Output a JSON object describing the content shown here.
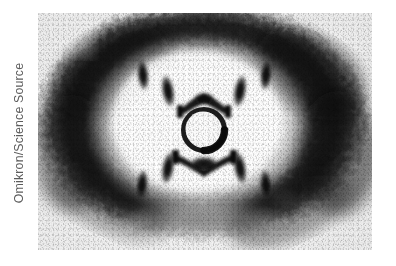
{
  "page": {
    "background_color": "#ffffff",
    "width": 396,
    "height": 266
  },
  "credit": {
    "text": "Omikron/Science Source",
    "color": "#5c5c5c",
    "orientation": "vertical-rotated-90-ccw",
    "position": "left-edge"
  },
  "photo": {
    "kind": "x-ray-diffraction-photograph",
    "subject": "DNA B-form fibre diffraction pattern (Photo 51)",
    "rendering": "black-and-white halftone print",
    "frame": {
      "x": 38,
      "y": 13,
      "width": 334,
      "height": 237
    },
    "colors": {
      "paper": "#f4f4f4",
      "bright_center": "#fbfbfb",
      "halo_dark": "#1c1c1c",
      "spot_dark": "#121212",
      "mid_gray": "#8a8a8a"
    },
    "features": {
      "outer_halo": {
        "label": "diffuse dark elliptical halo ring",
        "center_x": 196,
        "center_y": 118,
        "radius_x": 162,
        "radius_y": 116,
        "band_thickness": 46
      },
      "beamstop": {
        "label": "central beamstop shadow (white ring)",
        "center_x": 166,
        "center_y": 116,
        "radius": 20
      },
      "meridional_arcs": [
        {
          "label": "upper meridional arc",
          "center_x": 166,
          "center_y": 88
        },
        {
          "label": "lower meridional arc",
          "center_x": 166,
          "center_y": 146
        }
      ],
      "layer_line_spots": [
        {
          "arm": "upper-left",
          "index": 1,
          "cx": 130,
          "cy": 78,
          "rx": 6,
          "ry": 16,
          "tilt": -8
        },
        {
          "arm": "upper-left",
          "index": 2,
          "cx": 106,
          "cy": 64,
          "rx": 5.5,
          "ry": 15,
          "tilt": -6
        },
        {
          "arm": "upper-right",
          "index": 1,
          "cx": 203,
          "cy": 78,
          "rx": 6,
          "ry": 16,
          "tilt": 8
        },
        {
          "arm": "upper-right",
          "index": 2,
          "cx": 228,
          "cy": 64,
          "rx": 5.5,
          "ry": 15,
          "tilt": 6
        },
        {
          "arm": "lower-left",
          "index": 1,
          "cx": 130,
          "cy": 157,
          "rx": 6,
          "ry": 16,
          "tilt": 8
        },
        {
          "arm": "lower-left",
          "index": 2,
          "cx": 105,
          "cy": 172,
          "rx": 5.5,
          "ry": 15,
          "tilt": 6
        },
        {
          "arm": "lower-right",
          "index": 1,
          "cx": 203,
          "cy": 157,
          "rx": 6,
          "ry": 16,
          "tilt": -8
        },
        {
          "arm": "lower-right",
          "index": 2,
          "cx": 228,
          "cy": 172,
          "rx": 5.5,
          "ry": 15,
          "tilt": -6
        }
      ]
    }
  }
}
